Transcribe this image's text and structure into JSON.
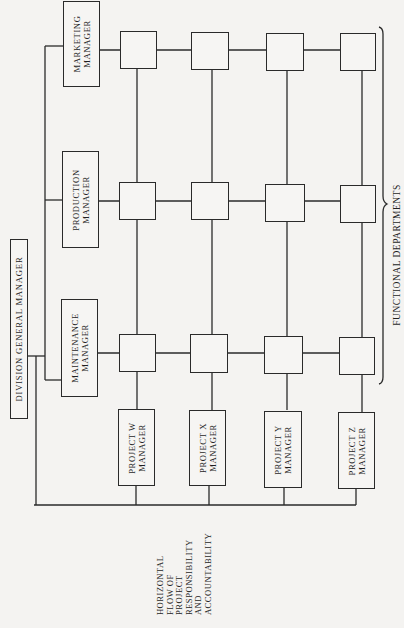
{
  "diagram": {
    "orientation": "rotated 90 degrees counterclockwise",
    "top_node": {
      "label": "DIVISION GENERAL MANAGER"
    },
    "functional_managers": [
      {
        "lines": [
          "MARKETING",
          "MANAGER"
        ]
      },
      {
        "lines": [
          "PRODUCTION",
          "MANAGER"
        ]
      },
      {
        "lines": [
          "MAINTENANCE",
          "MANAGER"
        ]
      }
    ],
    "project_managers": [
      {
        "lines": [
          "PROJECT W",
          "MANAGER"
        ]
      },
      {
        "lines": [
          "PROJECT X",
          "MANAGER"
        ]
      },
      {
        "lines": [
          "PROJECT Y",
          "MANAGER"
        ]
      },
      {
        "lines": [
          "PROJECT Z",
          "MANAGER"
        ]
      }
    ],
    "grid": {
      "rows": 3,
      "columns": 4,
      "cell_label": ""
    },
    "brace_label": "FUNCTIONAL DEPARTMENTS",
    "bottom_label_lines": [
      "HORIZONTAL",
      "FLOW OF",
      "PROJECT",
      "RESPONSIBILITY",
      "AND",
      "ACCOUNTABILITY"
    ],
    "colors": {
      "line": "#2a2a2a",
      "paper": "#f4f3f1"
    }
  }
}
